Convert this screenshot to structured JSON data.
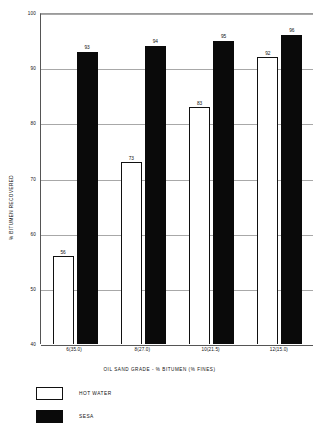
{
  "chart_data": {
    "type": "bar",
    "title": "",
    "xlabel": "OIL SAND GRADE - % BITUMEN (% FINES)",
    "ylabel": "% BITUMEN RECOVERED",
    "ylim": [
      40,
      100
    ],
    "yticks": [
      100,
      90,
      80,
      70,
      60,
      50,
      40
    ],
    "grid": true,
    "legend_position": "below-left",
    "categories": [
      "6(35.0)",
      "8(27.0)",
      "10(21.5)",
      "12(15.0)"
    ],
    "series": [
      {
        "name": "HOT WATER",
        "color": "#ffffff",
        "values": [
          56,
          73,
          83,
          92
        ]
      },
      {
        "name": "SESA",
        "color": "#0a0a0a",
        "values": [
          93,
          94,
          95,
          96
        ]
      }
    ]
  },
  "legend": {
    "items": [
      {
        "label": "HOT WATER",
        "swatch": "hot"
      },
      {
        "label": "SESA",
        "swatch": "sesa"
      }
    ]
  }
}
